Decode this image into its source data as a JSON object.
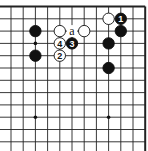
{
  "board": {
    "origin_x": 11,
    "origin_y": 6.5,
    "spacing_x": 12.2,
    "spacing_y": 12.3,
    "cols": 12,
    "rows": 12,
    "top_edge": true,
    "right_edge": true,
    "line_color": "#222222",
    "star_points": [
      [
        2,
        3
      ],
      [
        2,
        9
      ],
      [
        8,
        9
      ]
    ]
  },
  "stones": [
    {
      "color": "white",
      "col": 8,
      "row": 1,
      "label": ""
    },
    {
      "color": "black",
      "col": 9,
      "row": 1,
      "label": "1"
    },
    {
      "color": "black",
      "col": 9,
      "row": 2,
      "label": ""
    },
    {
      "color": "black",
      "col": 8,
      "row": 3,
      "label": ""
    },
    {
      "color": "black",
      "col": 8,
      "row": 5,
      "label": ""
    },
    {
      "color": "black",
      "col": 2,
      "row": 2,
      "label": ""
    },
    {
      "color": "black",
      "col": 2,
      "row": 4,
      "label": ""
    },
    {
      "color": "white",
      "col": 4,
      "row": 2,
      "label": ""
    },
    {
      "color": "white",
      "col": 6,
      "row": 2,
      "label": ""
    },
    {
      "color": "white",
      "col": 4,
      "row": 3,
      "label": "4"
    },
    {
      "color": "black",
      "col": 5,
      "row": 3,
      "label": "3"
    },
    {
      "color": "white",
      "col": 4,
      "row": 4,
      "label": "2"
    }
  ],
  "marks": [
    {
      "col": 5,
      "row": 2,
      "text": "a"
    }
  ]
}
